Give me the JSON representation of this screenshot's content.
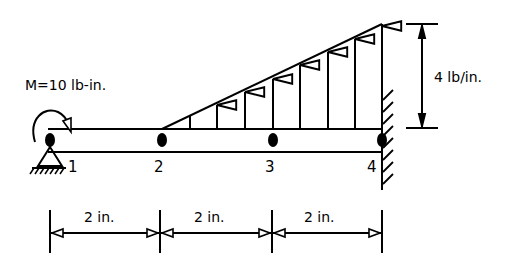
{
  "moment": {
    "label": "M=10 lb-in."
  },
  "load": {
    "magnitude_label": "4 lb/in."
  },
  "nodes": [
    {
      "id": "1"
    },
    {
      "id": "2"
    },
    {
      "id": "3"
    },
    {
      "id": "4"
    }
  ],
  "dimensions": [
    {
      "label": "2 in."
    },
    {
      "label": "2 in."
    },
    {
      "label": "2 in."
    }
  ],
  "colors": {
    "line": "#000000",
    "background": "#ffffff"
  }
}
